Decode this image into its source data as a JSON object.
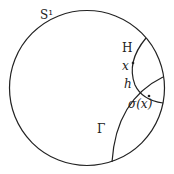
{
  "labels": {
    "circle": "S¹",
    "horocycle": "H",
    "point_x": "x",
    "point_h": "h",
    "sigma_x": "σ(x)",
    "geodesic": "Γ"
  },
  "colors": {
    "stroke": "#222222",
    "background": "#ffffff"
  }
}
